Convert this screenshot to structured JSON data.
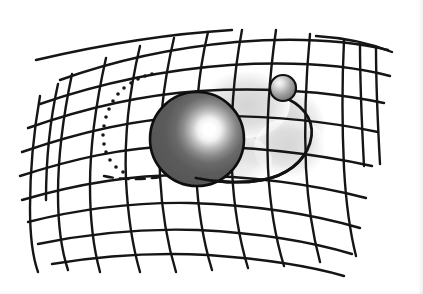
{
  "image": {
    "kind": "illustration",
    "subject": "spacetime-curvature-diagram",
    "caption": "",
    "background_color": "#ffffff",
    "width": 423,
    "height": 294
  },
  "palette": {
    "ink": "#121212",
    "grid_line": "#151515",
    "sphere_body": "#585858",
    "sphere_body_dark": "#4a4a4a",
    "sphere_highlight": "#ffffff",
    "sphere_outline": "#101010",
    "small_sphere_body": "#767676",
    "small_sphere_highlight": "#f2f2f2",
    "shadow_gray": "#d9d9d9",
    "shadow_gray_soft": "#e6e6e6",
    "page_white": "#ffffff"
  },
  "objects": {
    "grid": {
      "name": "spacetime-fabric-grid",
      "line_color": "#151515",
      "line_width": 2.4,
      "horizontal_line_count": 11,
      "vertical_line_count": 13,
      "style": "hand-drawn wavy mesh, perspective, sagging toward center"
    },
    "massive_body": {
      "name": "large-sphere",
      "label": "",
      "center_x": 197,
      "center_y": 139,
      "radius": 47,
      "fill": "#585858",
      "highlight_x": 210,
      "highlight_y": 120,
      "highlight_radius": 26
    },
    "orbiting_body": {
      "name": "small-sphere",
      "label": "",
      "center_x": 283,
      "center_y": 88,
      "radius": 13,
      "fill": "#767676",
      "highlight_x": 279,
      "highlight_y": 83,
      "highlight_radius": 8
    },
    "orbit_path": {
      "name": "orbit-ellipse",
      "visible_segment_color": "#121212",
      "hidden_segment_style": "dotted",
      "line_width": 2.6
    },
    "shadow": {
      "name": "curvature-shadow",
      "fill": "#d9d9d9",
      "center_x": 268,
      "center_y": 128
    }
  },
  "geometry": {
    "horizontal_lines": [
      "M 60 80 C 110 62, 170 48, 236 42 C 300 37, 350 41, 388 50",
      "M 40 104 C 95 85, 160 70, 230 65 C 298 61, 352 66, 390 76",
      "M 28 128 C 82 109, 140 95, 200 91 C 265 87, 330 92, 384 103",
      "M 22 152 C 74 134, 128 120, 186 117 C 252 114, 320 120, 378 132",
      "M 20 176 C 70 160, 122 147, 180 146 C 244 146, 312 153, 372 166",
      "M 22 200 C 70 186, 124 175, 184 175 C 248 176, 312 184, 366 198",
      "M 28 222 C 76 210, 130 202, 190 203 C 252 205, 312 214, 360 228",
      "M 38 244 C 86 234, 140 228, 198 230 C 258 233, 312 242, 352 254",
      "M 52 264 C 100 256, 152 252, 208 255 C 264 259, 310 266, 344 276",
      "M 36 60 C 96 46, 164 34, 232 30",
      "M 316 36 C 348 38, 372 44, 392 52"
    ],
    "vertical_lines": [
      "M 40 96 C 34 130, 30 170, 30 208 C 30 236, 33 258, 38 272",
      "M 72 74 C 64 112, 58 152, 58 194 C 58 226, 62 252, 68 270",
      "M 106 58 C 97 98, 90 142, 90 186 C 90 222, 94 250, 100 272",
      "M 140 46 C 130 88, 124 134, 126 180 C 128 218, 133 248, 140 272",
      "M 174 38 C 164 80, 158 128, 160 176 C 162 214, 168 246, 176 272",
      "M 208 32 C 198 74, 194 122, 196 172 C 198 212, 204 244, 212 270",
      "M 242 30 C 234 72, 230 120, 232 170 C 234 210, 240 242, 248 268",
      "M 276 30 C 270 72, 266 120, 268 168 C 270 208, 276 240, 284 266",
      "M 310 34 C 306 76, 304 122, 306 168 C 308 206, 313 236, 320 262",
      "M 344 40 C 342 82, 342 126, 344 168 C 346 204, 350 232, 356 256",
      "M 376 48 C 376 88, 378 128, 380 164",
      "M 58 84 C 50 120, 46 160, 46 200",
      "M 360 44 C 360 86, 362 128, 364 166"
    ],
    "orbit_visible": "M 288 99 C 306 108, 316 124, 310 143 C 304 162, 286 176, 262 180 C 240 184, 214 182, 196 178",
    "orbit_hidden_dots": [
      [
        152,
        74
      ],
      [
        145,
        76
      ],
      [
        138,
        79
      ],
      [
        131,
        83
      ],
      [
        124,
        88
      ],
      [
        118,
        94
      ],
      [
        113,
        101
      ],
      [
        109,
        109
      ],
      [
        106,
        117
      ],
      [
        104,
        126
      ],
      [
        103,
        135
      ],
      [
        104,
        144
      ],
      [
        106,
        152
      ],
      [
        110,
        160
      ],
      [
        116,
        167
      ],
      [
        123,
        172
      ]
    ],
    "orbit_dashed": "M 104 176 C 122 180, 142 180, 160 177"
  }
}
